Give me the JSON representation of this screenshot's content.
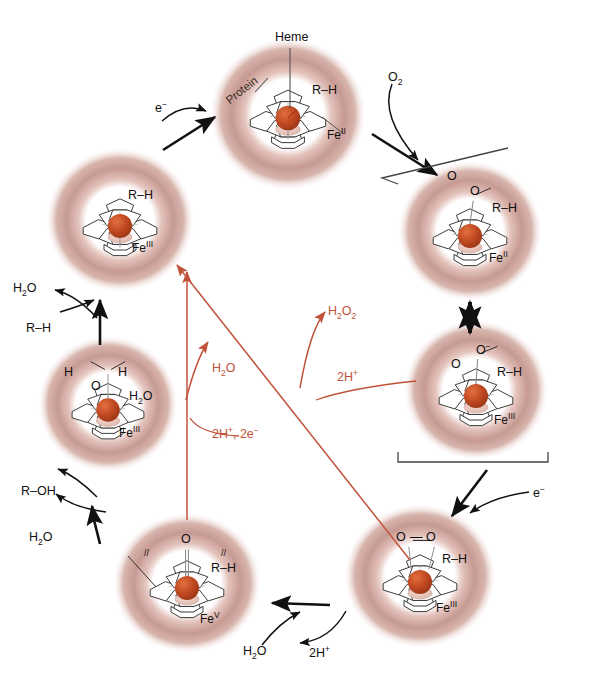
{
  "diagram": {
    "colors": {
      "protein_outer": "#c69a92",
      "protein_inner": "#e8cfc9",
      "heme_iron": "#c0431e",
      "arrow_black": "#111111",
      "arrow_red": "#c0523a",
      "background": "#ffffff"
    }
  },
  "callouts": {
    "heme": "Heme",
    "protein": "Protein"
  },
  "complexes": [
    {
      "id": "ferrous-substrate",
      "position": "top",
      "substrate": "R–H",
      "iron": "Fe",
      "oxidation": "II",
      "ligand": "",
      "ligand_label": ""
    },
    {
      "id": "oxy-ferrous",
      "position": "upper-right",
      "substrate": "R–H",
      "iron": "Fe",
      "oxidation": "II",
      "ligand": "O–O",
      "ligand_label": ""
    },
    {
      "id": "ferric-superoxo",
      "position": "right",
      "substrate": "R–H",
      "iron": "Fe",
      "oxidation": "III",
      "ligand": "O–O⁻",
      "ligand_label": ""
    },
    {
      "id": "ferric-peroxo",
      "position": "lower-right",
      "substrate": "R–H",
      "iron": "Fe",
      "oxidation": "III",
      "ligand": "O–O",
      "ligand_label": ""
    },
    {
      "id": "compound-one",
      "position": "lower-left",
      "substrate": "R–H",
      "iron": "Fe",
      "oxidation": "V",
      "ligand": "O",
      "ligand_label": ""
    },
    {
      "id": "ferric-aqua",
      "position": "left",
      "substrate": "",
      "iron": "Fe",
      "oxidation": "III",
      "ligand": "H–O–H",
      "ligand_label": "H2O"
    },
    {
      "id": "ferric-substrate",
      "position": "upper-left",
      "substrate": "R–H",
      "iron": "Fe",
      "oxidation": "III",
      "ligand": "",
      "ligand_label": ""
    }
  ],
  "reactants": {
    "electron_1": "e−",
    "electron_2": "e−",
    "dioxygen": "O2",
    "water_out_top": "H2O",
    "substrate_in": "R–H",
    "product_out": "R–OH",
    "water_in": "H2O",
    "water_out_bottom": "H2O",
    "protons_bottom": "2H+"
  },
  "uncoupling": {
    "peroxide": "H2O2",
    "protons_peroxide": "2H+",
    "water": "H2O",
    "protons_electrons": "2H+, 2e−"
  },
  "labels": {
    "subscript_2": "2",
    "superscript_plus": "+",
    "superscript_minus": "−",
    "roman_two": "II",
    "roman_three": "III",
    "roman_five": "V"
  }
}
